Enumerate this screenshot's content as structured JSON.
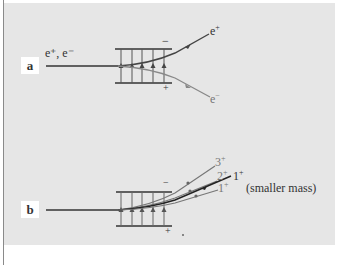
{
  "panel_a": {
    "label": "a",
    "incoming_label": "e⁺, e⁻",
    "plate_top_sign": "−",
    "plate_bottom_sign": "+",
    "out_upper": {
      "base": "e",
      "sup": "+"
    },
    "out_lower": {
      "base": "e",
      "sup": "−"
    }
  },
  "panel_b": {
    "label": "b",
    "plate_top_sign": "−",
    "plate_bottom_sign": "+",
    "beam_3": {
      "base": "3",
      "sup": "+"
    },
    "beam_2": {
      "base": "2",
      "sup": "+"
    },
    "beam_1_heavy": {
      "base": "1",
      "sup": "+"
    },
    "beam_1": {
      "base": "1",
      "sup": "+"
    },
    "note": "(smaller mass)"
  },
  "colors": {
    "panel_bg": "#e6e6e6",
    "line_dark": "#333333",
    "line_gray": "#7a7a7a"
  }
}
